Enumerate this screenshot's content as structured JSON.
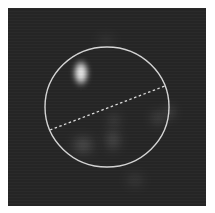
{
  "image": {
    "type": "fluorescence-micrograph",
    "background_color": "#262626",
    "frame_color": "#ffffff"
  },
  "roi": {
    "shape": "circle",
    "cx": 99,
    "cy": 99,
    "rx": 62,
    "ry": 60,
    "stroke_color": "#d8d8d8"
  },
  "line_profile": {
    "style": "dashed",
    "x1": 42,
    "y1": 122,
    "x2": 157,
    "y2": 78,
    "stroke_color": "#e0e0e0"
  },
  "spots": [
    {
      "label": "bright-spot",
      "cx": 73,
      "cy": 65,
      "rx": 9,
      "ry": 15,
      "intensity": 0.95
    },
    {
      "label": "faint-spot-lower-left",
      "cx": 75,
      "cy": 137,
      "rx": 14,
      "ry": 12,
      "intensity": 0.22
    },
    {
      "label": "faint-spot-center",
      "cx": 105,
      "cy": 132,
      "rx": 10,
      "ry": 14,
      "intensity": 0.2
    },
    {
      "label": "faint-spot-center-upper",
      "cx": 106,
      "cy": 112,
      "rx": 9,
      "ry": 9,
      "intensity": 0.14
    },
    {
      "label": "faint-spot-right",
      "cx": 150,
      "cy": 110,
      "rx": 10,
      "ry": 10,
      "intensity": 0.16
    },
    {
      "label": "faint-spot-right-edge",
      "cx": 162,
      "cy": 104,
      "rx": 7,
      "ry": 9,
      "intensity": 0.18
    },
    {
      "label": "faint-spot-bottom",
      "cx": 127,
      "cy": 172,
      "rx": 12,
      "ry": 10,
      "intensity": 0.1
    },
    {
      "label": "faint-spot-top",
      "cx": 98,
      "cy": 32,
      "rx": 12,
      "ry": 8,
      "intensity": 0.08
    }
  ]
}
